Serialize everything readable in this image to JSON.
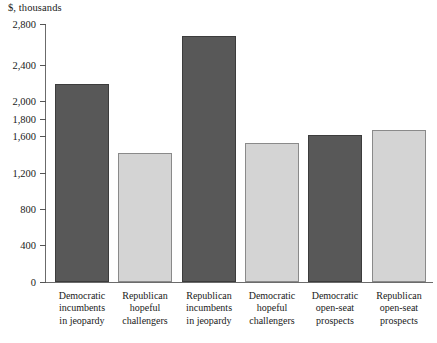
{
  "chart_data": {
    "type": "bar",
    "title": "",
    "subtitle": "",
    "xlabel": "",
    "ylabel": "$, thousands",
    "axis_unit_label": "$, thousands",
    "categories": [
      "Democratic incumbents in jeopardy",
      "Republican hopeful challengers",
      "Republican incumbents in jeopardy",
      "Democratic hopeful challengers",
      "Democratic open-seat prospects",
      "Republican open-seat prospects"
    ],
    "category_lines": [
      [
        "Democratic",
        "incumbents",
        "in jeopardy"
      ],
      [
        "Republican",
        "hopeful",
        "challengers"
      ],
      [
        "Republican",
        "incumbents",
        "in jeopardy"
      ],
      [
        "Democratic",
        "hopeful",
        "challengers"
      ],
      [
        "Democratic",
        "open-seat",
        "prospects"
      ],
      [
        "Republican",
        "open-seat",
        "prospects"
      ]
    ],
    "values": [
      2190,
      1420,
      2680,
      1520,
      1610,
      1670
    ],
    "bar_colors": [
      "#585858",
      "#d4d4d4",
      "#585858",
      "#d4d4d4",
      "#585858",
      "#d4d4d4"
    ],
    "ytick_labels": [
      "0",
      "400",
      "800",
      "1,200",
      "1,600",
      "1,800",
      "2,000",
      "2,400",
      "2,800"
    ],
    "ytick_values": [
      0,
      400,
      800,
      1200,
      1600,
      1800,
      2000,
      2400,
      2800
    ],
    "ylim": [
      0,
      2800
    ],
    "grid": false,
    "legend": false,
    "axis_note": "non-linear y-axis: compressed spacing between 1,200 and 2,400"
  },
  "colors": {
    "dark_bar": "#585858",
    "light_bar": "#d4d4d4",
    "axis": "#6b6b6b",
    "text": "#1a1a1a"
  }
}
